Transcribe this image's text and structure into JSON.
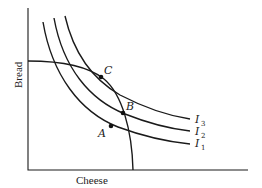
{
  "diagram": {
    "type": "indifference-curves-with-budget-constraint",
    "axes": {
      "x_label": "Cheese",
      "y_label": "Bread"
    },
    "curves": [
      {
        "name": "I",
        "subscript": "1",
        "kind": "indifference-curve"
      },
      {
        "name": "I",
        "subscript": "2",
        "kind": "indifference-curve"
      },
      {
        "name": "I",
        "subscript": "3",
        "kind": "indifference-curve"
      }
    ],
    "budget_constraint": {
      "kind": "concave-budget-line"
    },
    "points": [
      {
        "label": "A"
      },
      {
        "label": "B"
      },
      {
        "label": "C"
      }
    ],
    "colors": {
      "ink": "#1a1a1a",
      "background": "#ffffff"
    }
  }
}
